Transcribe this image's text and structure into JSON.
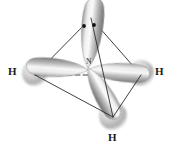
{
  "figure": {
    "background_color": "#ffffff",
    "width": 173,
    "height": 150
  },
  "molecule": {
    "name": "ammonia",
    "formula": "NH3",
    "geometry": "tetrahedral",
    "hybridization": "sp3",
    "central_atom": {
      "element_label": "N",
      "name": "nitrogen",
      "x": 88,
      "y": 68,
      "color": "#4a4a4a"
    },
    "terminal_atoms": [
      {
        "element_label": "H",
        "name": "hydrogen-left",
        "label_x": 8,
        "label_y": 66,
        "sphere_x": 35,
        "sphere_y": 73,
        "sphere_r": 13
      },
      {
        "element_label": "H",
        "name": "hydrogen-right",
        "label_x": 155,
        "label_y": 66,
        "sphere_x": 141,
        "sphere_y": 73,
        "sphere_r": 13
      },
      {
        "element_label": "H",
        "name": "hydrogen-bottom",
        "label_x": 108,
        "label_y": 132,
        "sphere_x": 113,
        "sphere_y": 116,
        "sphere_r": 14
      }
    ],
    "lone_pair": {
      "name": "lone-pair-electrons",
      "electron_count": 2,
      "dots": [
        {
          "x": 84,
          "y": 26,
          "r": 1.9
        },
        {
          "x": 94,
          "y": 25,
          "r": 1.9
        }
      ]
    }
  },
  "orbitals": [
    {
      "name": "sp3-lobe-up",
      "direction": "up",
      "tip_x": 91,
      "tip_y": 10,
      "length": 62,
      "width": 22,
      "angle_deg": -84
    },
    {
      "name": "sp3-lobe-left",
      "direction": "left",
      "tip_x": 36,
      "tip_y": 72,
      "length": 56,
      "width": 20,
      "angle_deg": 184
    },
    {
      "name": "sp3-lobe-right",
      "direction": "right",
      "tip_x": 140,
      "tip_y": 72,
      "length": 56,
      "width": 20,
      "angle_deg": 4
    },
    {
      "name": "sp3-lobe-down-front",
      "direction": "down-front",
      "tip_x": 112,
      "tip_y": 116,
      "length": 55,
      "width": 20,
      "angle_deg": 60
    }
  ],
  "tetrahedron": {
    "name": "tetrahedral-framework",
    "vertices": {
      "apex": {
        "x": 91,
        "y": 18
      },
      "left": {
        "x": 35,
        "y": 75
      },
      "right": {
        "x": 141,
        "y": 75
      },
      "front": {
        "x": 113,
        "y": 117
      }
    },
    "solid_edges": [
      {
        "from": "apex",
        "to": "left"
      },
      {
        "from": "apex",
        "to": "right"
      },
      {
        "from": "apex",
        "to": "front"
      },
      {
        "from": "left",
        "to": "front"
      },
      {
        "from": "right",
        "to": "front"
      }
    ],
    "dashed_edges": [
      {
        "from": "left",
        "to": "right"
      }
    ],
    "edge_color": "#2b2b2b",
    "edge_width": 0.9,
    "dash_pattern": "5 3"
  },
  "palette": {
    "orbital_light": "#f2f2f2",
    "orbital_mid": "#b8b8b8",
    "orbital_dark": "#6e6e6e",
    "orbital_outline": "#8a8a8a",
    "sphere_light": "#e8e8e8",
    "sphere_mid": "#bdbdbd",
    "sphere_dark": "#9a9a9a",
    "label_color": "#1a1a1a",
    "line_color": "#2b2b2b"
  }
}
